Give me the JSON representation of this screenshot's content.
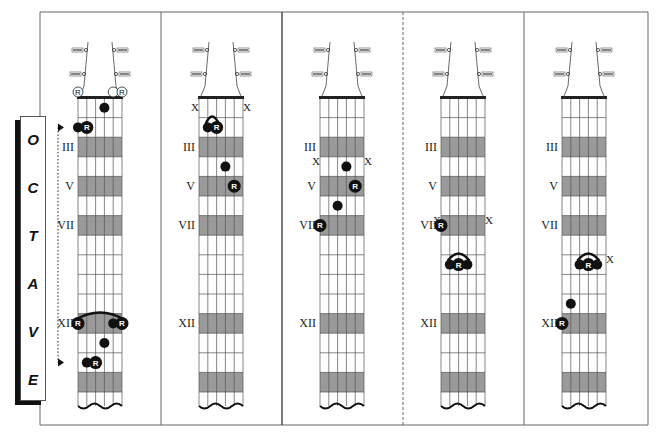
{
  "octave_label": {
    "letters": [
      "O",
      "C",
      "T",
      "A",
      "V",
      "E"
    ]
  },
  "colors": {
    "shaded_fret": "#9a9a9a",
    "ink": "#111111",
    "grid": "#555555",
    "border": "#666666"
  },
  "fret_labels": [
    "III",
    "V",
    "VII",
    "XII"
  ],
  "marker_labels": {
    "root": "R",
    "muted": "X"
  },
  "panels": [
    {
      "id": "panel-1",
      "fret_labels": [
        {
          "text": "III",
          "fret": 3
        },
        {
          "text": "V",
          "fret": 5
        },
        {
          "text": "VII",
          "fret": 7
        },
        {
          "text": "XII",
          "fret": 12
        }
      ],
      "open_strings": [
        {
          "string": 1,
          "root": true
        },
        {
          "string": 5,
          "root": false
        },
        {
          "string": 6,
          "root": true
        }
      ],
      "muted_strings": [],
      "notes": [
        {
          "string": 4,
          "fret": 1,
          "root": false
        },
        {
          "string": 1,
          "fret": 2,
          "root": false
        },
        {
          "string": 2,
          "fret": 2,
          "root": true
        },
        {
          "string": 1,
          "fret": 12,
          "root": true
        },
        {
          "string": 5,
          "fret": 12,
          "root": false
        },
        {
          "string": 6,
          "fret": 12,
          "root": true
        },
        {
          "string": 4,
          "fret": 13,
          "root": false
        },
        {
          "string": 2,
          "fret": 14,
          "root": false
        },
        {
          "string": 3,
          "fret": 14,
          "root": true
        }
      ],
      "barres": [
        {
          "fret": 12,
          "from": 1,
          "to": 6
        }
      ],
      "octave_arrow": true
    },
    {
      "id": "panel-2",
      "fret_labels": [
        {
          "text": "III",
          "fret": 3
        },
        {
          "text": "V",
          "fret": 5
        },
        {
          "text": "VII",
          "fret": 7
        },
        {
          "text": "XII",
          "fret": 12
        }
      ],
      "open_strings": [],
      "muted_strings": [
        {
          "string": 1,
          "at_fret": 0
        },
        {
          "string": 6,
          "at_fret": 0
        }
      ],
      "notes": [
        {
          "string": 2,
          "fret": 2,
          "root": false
        },
        {
          "string": 3,
          "fret": 2,
          "root": true
        },
        {
          "string": 4,
          "fret": 4,
          "root": false
        },
        {
          "string": 5,
          "fret": 5,
          "root": true
        }
      ],
      "barres": [
        {
          "fret": 2,
          "from": 2,
          "to": 3
        }
      ]
    },
    {
      "id": "panel-3",
      "fret_labels": [
        {
          "text": "III",
          "fret": 3
        },
        {
          "text": "V",
          "fret": 5
        },
        {
          "text": "VII",
          "fret": 7
        },
        {
          "text": "XII",
          "fret": 12
        }
      ],
      "open_strings": [],
      "muted_strings": [
        {
          "string": 1,
          "at_fret": 3
        },
        {
          "string": 6,
          "at_fret": 3
        }
      ],
      "notes": [
        {
          "string": 4,
          "fret": 4,
          "root": false
        },
        {
          "string": 5,
          "fret": 5,
          "root": true
        },
        {
          "string": 3,
          "fret": 6,
          "root": false
        },
        {
          "string": 1,
          "fret": 7,
          "root": true
        }
      ],
      "barres": []
    },
    {
      "id": "panel-4",
      "fret_labels": [
        {
          "text": "III",
          "fret": 3
        },
        {
          "text": "V",
          "fret": 5
        },
        {
          "text": "VII",
          "fret": 7
        },
        {
          "text": "XII",
          "fret": 12
        }
      ],
      "open_strings": [],
      "muted_strings": [
        {
          "string": 1,
          "at_fret": 6
        },
        {
          "string": 6,
          "at_fret": 6
        }
      ],
      "notes": [
        {
          "string": 1,
          "fret": 7,
          "root": true
        },
        {
          "string": 2,
          "fret": 9,
          "root": false
        },
        {
          "string": 3,
          "fret": 9,
          "root": true
        },
        {
          "string": 4,
          "fret": 9,
          "root": false
        }
      ],
      "barres": [
        {
          "fret": 9,
          "from": 2,
          "to": 4
        }
      ]
    },
    {
      "id": "panel-5",
      "fret_labels": [
        {
          "text": "III",
          "fret": 3
        },
        {
          "text": "V",
          "fret": 5
        },
        {
          "text": "VII",
          "fret": 7
        },
        {
          "text": "XII",
          "fret": 12
        }
      ],
      "open_strings": [],
      "muted_strings": [
        {
          "string": 6,
          "at_fret": 8
        }
      ],
      "notes": [
        {
          "string": 3,
          "fret": 9,
          "root": false
        },
        {
          "string": 4,
          "fret": 9,
          "root": true
        },
        {
          "string": 5,
          "fret": 9,
          "root": false
        },
        {
          "string": 2,
          "fret": 11,
          "root": false
        },
        {
          "string": 1,
          "fret": 12,
          "root": true
        }
      ],
      "barres": [
        {
          "fret": 9,
          "from": 3,
          "to": 5
        }
      ]
    }
  ]
}
